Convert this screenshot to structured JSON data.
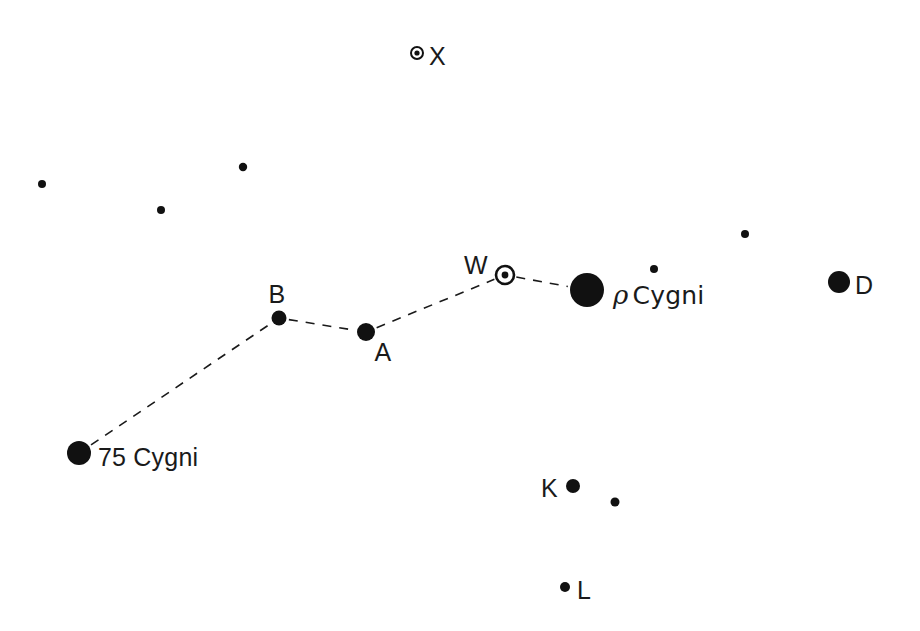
{
  "chart_data": {
    "type": "scatter",
    "title": "",
    "subtitle": "",
    "xlabel": "",
    "ylabel": "",
    "xlim": [
      0,
      920
    ],
    "ylim": [
      0,
      631
    ],
    "grid": false,
    "legend": "none",
    "background_color": "#ffffff",
    "ink_color": "#111111",
    "marker_types": {
      "filled": "filled-disc",
      "circled": "circle-with-center-dot"
    },
    "points": [
      {
        "id": "x-star",
        "label": "X",
        "label_text": "X",
        "x": 417,
        "y": 53,
        "radius": 6,
        "marker": "circled",
        "inner_radius": 2.6,
        "label_dx": 12,
        "label_dy": 9,
        "label_anchor": "start",
        "on_asterism": false
      },
      {
        "id": "field-1",
        "label": "",
        "label_text": "",
        "x": 42,
        "y": 184,
        "radius": 4,
        "marker": "filled",
        "inner_radius": 0,
        "label_dx": 0,
        "label_dy": 0,
        "label_anchor": "start",
        "on_asterism": false
      },
      {
        "id": "field-2",
        "label": "",
        "label_text": "",
        "x": 243,
        "y": 167,
        "radius": 4.2,
        "marker": "filled",
        "inner_radius": 0,
        "label_dx": 0,
        "label_dy": 0,
        "label_anchor": "start",
        "on_asterism": false
      },
      {
        "id": "field-3",
        "label": "",
        "label_text": "",
        "x": 161,
        "y": 210,
        "radius": 4,
        "marker": "filled",
        "inner_radius": 0,
        "label_dx": 0,
        "label_dy": 0,
        "label_anchor": "start",
        "on_asterism": false
      },
      {
        "id": "field-4",
        "label": "",
        "label_text": "",
        "x": 745,
        "y": 234,
        "radius": 4,
        "marker": "filled",
        "inner_radius": 0,
        "label_dx": 0,
        "label_dy": 0,
        "label_anchor": "start",
        "on_asterism": false
      },
      {
        "id": "field-5",
        "label": "",
        "label_text": "",
        "x": 654,
        "y": 269,
        "radius": 4,
        "marker": "filled",
        "inner_radius": 0,
        "label_dx": 0,
        "label_dy": 0,
        "label_anchor": "start",
        "on_asterism": false
      },
      {
        "id": "field-6",
        "label": "",
        "label_text": "",
        "x": 615,
        "y": 502,
        "radius": 4.5,
        "marker": "filled",
        "inner_radius": 0,
        "label_dx": 0,
        "label_dy": 0,
        "label_anchor": "start",
        "on_asterism": false
      },
      {
        "id": "w-star",
        "label": "W",
        "label_text": "W",
        "x": 505,
        "y": 275,
        "radius": 9,
        "marker": "circled",
        "inner_radius": 3.4,
        "label_dx": -17,
        "label_dy": -4,
        "label_anchor": "end",
        "on_asterism": true
      },
      {
        "id": "rho-cygni",
        "label": "rho Cygni",
        "label_text": "Cygni",
        "x": 587,
        "y": 290,
        "radius": 17,
        "marker": "filled",
        "inner_radius": 0,
        "label_dx": 26,
        "label_dy": 10,
        "label_anchor": "start",
        "on_asterism": true
      },
      {
        "id": "d-star",
        "label": "D",
        "label_text": "D",
        "x": 839,
        "y": 282,
        "radius": 11,
        "marker": "filled",
        "inner_radius": 0,
        "label_dx": 16,
        "label_dy": 9,
        "label_anchor": "start",
        "on_asterism": false
      },
      {
        "id": "b-star",
        "label": "B",
        "label_text": "B",
        "x": 279,
        "y": 318,
        "radius": 7.5,
        "marker": "filled",
        "inner_radius": 0,
        "label_dx": -2,
        "label_dy": -18,
        "label_anchor": "middle",
        "on_asterism": true
      },
      {
        "id": "a-star",
        "label": "A",
        "label_text": "A",
        "x": 366,
        "y": 332,
        "radius": 9,
        "marker": "filled",
        "inner_radius": 0,
        "label_dx": 17,
        "label_dy": 26,
        "label_anchor": "middle",
        "on_asterism": true
      },
      {
        "id": "star-75-cygni",
        "label": "75 Cygni",
        "label_text": "75 Cygni",
        "x": 79,
        "y": 453,
        "radius": 12,
        "marker": "filled",
        "inner_radius": 0,
        "label_dx": 19,
        "label_dy": 10,
        "label_anchor": "start",
        "on_asterism": true
      },
      {
        "id": "k-star",
        "label": "K",
        "label_text": "K",
        "x": 573,
        "y": 486,
        "radius": 7,
        "marker": "filled",
        "inner_radius": 0,
        "label_dx": -15,
        "label_dy": 8,
        "label_anchor": "end",
        "on_asterism": false
      },
      {
        "id": "l-star",
        "label": "L",
        "label_text": "L",
        "x": 565,
        "y": 587,
        "radius": 5,
        "marker": "filled",
        "inner_radius": 0,
        "label_dx": 12,
        "label_dy": 9,
        "label_anchor": "start",
        "on_asterism": false
      }
    ],
    "asterism": {
      "name": "rho Cygni asterism",
      "style": "dashed",
      "dash_pattern": "9 8",
      "stroke_width": 1.6,
      "color": "#1a1a1a",
      "path_ids": [
        "star-75-cygni",
        "b-star",
        "a-star",
        "w-star",
        "rho-cygni"
      ]
    },
    "labels": {
      "x": "X",
      "d": "D",
      "w": "W",
      "k": "K",
      "l": "L",
      "a": "A",
      "b": "B",
      "star_75": "75 Cygni",
      "rho_glyph": "ρ",
      "rho_name": "Cygni"
    }
  }
}
